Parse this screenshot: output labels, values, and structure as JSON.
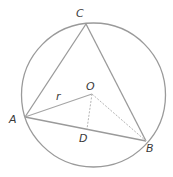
{
  "diagram": {
    "title": "",
    "circle": {
      "cx": 93.5,
      "cy": 95,
      "r": 72,
      "stroke": "#9a9a9a"
    },
    "points": {
      "A": {
        "x": 25,
        "y": 117,
        "label": "A",
        "lx": 9,
        "ly": 123
      },
      "B": {
        "x": 146,
        "y": 141,
        "label": "B",
        "lx": 146,
        "ly": 152
      },
      "C": {
        "x": 86,
        "y": 24,
        "label": "C",
        "lx": 76,
        "ly": 17
      },
      "O": {
        "x": 92,
        "y": 94,
        "label": "O",
        "lx": 86,
        "ly": 90
      },
      "D": {
        "x": 87,
        "y": 129,
        "label": "D",
        "lx": 79,
        "ly": 142
      }
    },
    "segment_labels": {
      "r": {
        "text": "r",
        "x": 56,
        "y": 100
      }
    },
    "colors": {
      "solid_line": "#9a9a9a",
      "dashed_line": "#b5b5b5",
      "label": "#3a3a3a"
    }
  }
}
